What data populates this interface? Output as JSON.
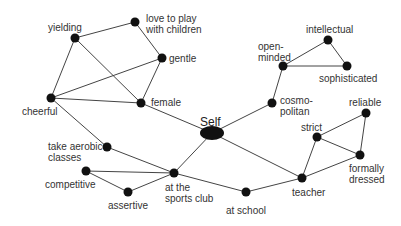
{
  "diagram": {
    "title": "",
    "colors": {
      "node": "#111111",
      "edge": "#444444",
      "text": "#333333",
      "background": "#ffffff"
    },
    "nodes": [
      {
        "id": "yielding",
        "label": "yielding",
        "x": 75,
        "y": 38,
        "lx": 48,
        "ly": 22
      },
      {
        "id": "love",
        "label": "love to play\nwith children",
        "x": 135,
        "y": 22,
        "lx": 146,
        "ly": 13
      },
      {
        "id": "gentle",
        "label": "gentle",
        "x": 162,
        "y": 58,
        "lx": 169,
        "ly": 53
      },
      {
        "id": "cheerful",
        "label": "cheerful",
        "x": 51,
        "y": 98,
        "lx": 22,
        "ly": 106
      },
      {
        "id": "female",
        "label": "female",
        "x": 141,
        "y": 103,
        "lx": 151,
        "ly": 97
      },
      {
        "id": "self",
        "label": "Self",
        "x": 212,
        "y": 133,
        "lx": 200,
        "ly": 116,
        "major": true
      },
      {
        "id": "intellectual",
        "label": "intellectual",
        "x": 328,
        "y": 40,
        "lx": 306,
        "ly": 24
      },
      {
        "id": "openminded",
        "label": "open-\nminded",
        "x": 283,
        "y": 66,
        "lx": 258,
        "ly": 41
      },
      {
        "id": "sophisticated",
        "label": "sophisticated",
        "x": 347,
        "y": 66,
        "lx": 319,
        "ly": 73
      },
      {
        "id": "cosmopolitan",
        "label": "cosmo-\npolitan",
        "x": 272,
        "y": 103,
        "lx": 280,
        "ly": 95
      },
      {
        "id": "reliable",
        "label": "reliable",
        "x": 366,
        "y": 113,
        "lx": 349,
        "ly": 97
      },
      {
        "id": "strict",
        "label": "strict",
        "x": 317,
        "y": 137,
        "lx": 301,
        "ly": 122
      },
      {
        "id": "formally",
        "label": "formally\ndressed",
        "x": 360,
        "y": 155,
        "lx": 349,
        "ly": 163
      },
      {
        "id": "teacher",
        "label": "teacher",
        "x": 302,
        "y": 178,
        "lx": 292,
        "ly": 187
      },
      {
        "id": "atschool",
        "label": "at school",
        "x": 246,
        "y": 192,
        "lx": 226,
        "ly": 205
      },
      {
        "id": "aerobic",
        "label": "take aerobic\nclasses",
        "x": 107,
        "y": 147,
        "lx": 48,
        "ly": 141
      },
      {
        "id": "competitive",
        "label": "competitive",
        "x": 86,
        "y": 171,
        "lx": 45,
        "ly": 179
      },
      {
        "id": "assertive",
        "label": "assertive",
        "x": 128,
        "y": 192,
        "lx": 108,
        "ly": 200
      },
      {
        "id": "sportsclub",
        "label": "at the\nsports club",
        "x": 174,
        "y": 173,
        "lx": 165,
        "ly": 182
      }
    ],
    "edges": [
      [
        "yielding",
        "love"
      ],
      [
        "love",
        "gentle"
      ],
      [
        "yielding",
        "cheerful"
      ],
      [
        "yielding",
        "female"
      ],
      [
        "gentle",
        "cheerful"
      ],
      [
        "gentle",
        "female"
      ],
      [
        "cheerful",
        "female"
      ],
      [
        "cheerful",
        "aerobic"
      ],
      [
        "female",
        "self"
      ],
      [
        "self",
        "cosmopolitan"
      ],
      [
        "cosmopolitan",
        "openminded"
      ],
      [
        "openminded",
        "intellectual"
      ],
      [
        "openminded",
        "sophisticated"
      ],
      [
        "intellectual",
        "sophisticated"
      ],
      [
        "self",
        "sportsclub"
      ],
      [
        "self",
        "teacher"
      ],
      [
        "aerobic",
        "sportsclub"
      ],
      [
        "competitive",
        "sportsclub"
      ],
      [
        "competitive",
        "assertive"
      ],
      [
        "assertive",
        "sportsclub"
      ],
      [
        "sportsclub",
        "atschool"
      ],
      [
        "atschool",
        "teacher"
      ],
      [
        "teacher",
        "strict"
      ],
      [
        "teacher",
        "formally"
      ],
      [
        "strict",
        "reliable"
      ],
      [
        "strict",
        "formally"
      ],
      [
        "reliable",
        "formally"
      ]
    ]
  }
}
